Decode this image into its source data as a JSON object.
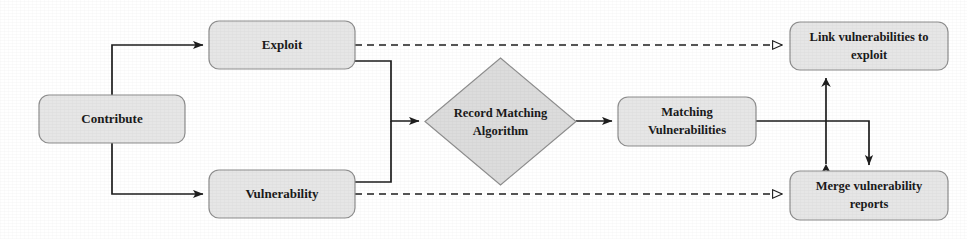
{
  "diagram": {
    "type": "flowchart",
    "background_color": "#ffffff",
    "node_fill_color": "#e6e6e6",
    "diamond_fill_color": "#dcdcdc",
    "node_stroke_color": "#8e8e8e",
    "edge_color": "#1e1e1e",
    "nodes": [
      {
        "id": "contribute",
        "shape": "rounded-rectangle",
        "label": "Contribute",
        "lines": [
          "Contribute"
        ],
        "x": 39,
        "y": 95,
        "w": 146,
        "h": 48
      },
      {
        "id": "exploit",
        "shape": "rounded-rectangle",
        "label": "Exploit",
        "lines": [
          "Exploit"
        ],
        "x": 209,
        "y": 21,
        "w": 146,
        "h": 48
      },
      {
        "id": "vulnerability",
        "shape": "rounded-rectangle",
        "label": "Vulnerability",
        "lines": [
          "Vulnerability"
        ],
        "x": 209,
        "y": 170,
        "w": 146,
        "h": 48
      },
      {
        "id": "record-matching-algorithm",
        "shape": "diamond",
        "label": "Record Matching Algorithm",
        "lines": [
          "Record Matching",
          "Algorithm"
        ],
        "x": 425,
        "y": 58,
        "w": 151,
        "h": 127
      },
      {
        "id": "matching-vulnerabilities",
        "shape": "rounded-rectangle",
        "label": "Matching Vulnerabilities",
        "lines": [
          "Matching",
          "Vulnerabilities"
        ],
        "x": 618,
        "y": 97,
        "w": 138,
        "h": 49
      },
      {
        "id": "link-vulnerabilities-to-exploit",
        "shape": "rounded-rectangle",
        "label": "Link vulnerabilities to exploit",
        "lines": [
          "Link vulnerabilities to",
          "exploit"
        ],
        "x": 790,
        "y": 22,
        "w": 158,
        "h": 48
      },
      {
        "id": "merge-vulnerability-reports",
        "shape": "rounded-rectangle",
        "label": "Merge vulnerability reports",
        "lines": [
          "Merge vulnerability",
          "reports"
        ],
        "x": 790,
        "y": 171,
        "w": 158,
        "h": 49
      }
    ],
    "edges": [
      {
        "id": "contribute-to-exploit",
        "from": "contribute",
        "to": "exploit",
        "style": "solid",
        "arrow": "filled",
        "routing": "orthogonal"
      },
      {
        "id": "contribute-to-vulnerability",
        "from": "contribute",
        "to": "vulnerability",
        "style": "solid",
        "arrow": "filled",
        "routing": "orthogonal"
      },
      {
        "id": "exploit-to-algorithm",
        "from": "exploit",
        "to": "record-matching-algorithm",
        "style": "solid",
        "arrow": "filled",
        "routing": "orthogonal"
      },
      {
        "id": "vulnerability-to-algorithm",
        "from": "vulnerability",
        "to": "record-matching-algorithm",
        "style": "solid",
        "arrow": "filled",
        "routing": "orthogonal"
      },
      {
        "id": "algorithm-to-matching-vulnerabilities",
        "from": "record-matching-algorithm",
        "to": "matching-vulnerabilities",
        "style": "solid",
        "arrow": "filled",
        "routing": "straight"
      },
      {
        "id": "exploit-to-link-vulnerabilities",
        "from": "exploit",
        "to": "link-vulnerabilities-to-exploit",
        "style": "dashed",
        "arrow": "hollow",
        "routing": "straight"
      },
      {
        "id": "vulnerability-to-merge-reports",
        "from": "vulnerability",
        "to": "merge-vulnerability-reports",
        "style": "dashed",
        "arrow": "hollow",
        "routing": "straight"
      },
      {
        "id": "matching-vulnerabilities-to-merge-reports",
        "from": "matching-vulnerabilities",
        "to": "merge-vulnerability-reports",
        "style": "solid",
        "arrow": "filled",
        "routing": "orthogonal"
      },
      {
        "id": "link-merge-bidirectional",
        "from": "link-vulnerabilities-to-exploit",
        "to": "merge-vulnerability-reports",
        "style": "solid",
        "arrow": "double",
        "routing": "straight"
      }
    ]
  }
}
